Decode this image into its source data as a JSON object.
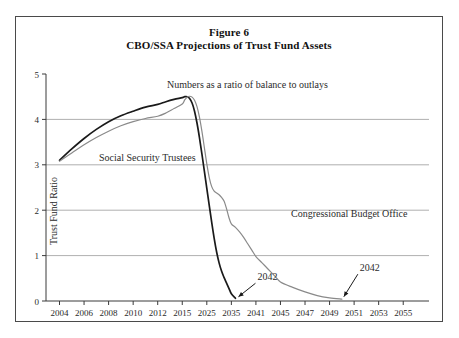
{
  "figure": {
    "title_line1": "Figure 6",
    "title_line2": "CBO/SSA Projections of Trust Fund Assets"
  },
  "chart_data": {
    "type": "line",
    "title": "CBO/SSA Projections of Trust Fund Assets",
    "subtitle": "Figure 6",
    "xlabel": "",
    "ylabel": "Trust Fund Ratio",
    "xlim": [
      2004,
      2056
    ],
    "ylim": [
      0,
      5
    ],
    "yticks": [
      0,
      1,
      2,
      3,
      4,
      5
    ],
    "xticks": [
      2004,
      2006,
      2008,
      2010,
      2012,
      2015,
      2025,
      2035,
      2041,
      2045,
      2047,
      2049,
      2051,
      2053,
      2055
    ],
    "xtick_labels": [
      "2004",
      "2006",
      "2008",
      "2010",
      "2012",
      "2015",
      "2025",
      "2035",
      "2041",
      "2045",
      "2047",
      "2049",
      "2051",
      "2053",
      "2055"
    ],
    "grid": "horizontal",
    "legend_position": "inline-annotations",
    "annotations": [
      {
        "name": "ratio-note",
        "text": "Numbers as a ratio of balance to outlays"
      },
      {
        "name": "trustees-label",
        "text": "Social Security Trustees"
      },
      {
        "name": "cbo-label",
        "text": "Congressional Budget Office"
      },
      {
        "name": "trustees-endpoint-year",
        "text": "2042"
      },
      {
        "name": "cbo-endpoint-year",
        "text": "2042"
      }
    ],
    "series": [
      {
        "name": "Social Security Trustees",
        "color": "#1a1a1a",
        "points": [
          [
            2004,
            3.1
          ],
          [
            2005,
            3.35
          ],
          [
            2006,
            3.58
          ],
          [
            2007,
            3.78
          ],
          [
            2008,
            3.95
          ],
          [
            2009,
            4.08
          ],
          [
            2010,
            4.18
          ],
          [
            2011,
            4.27
          ],
          [
            2012,
            4.33
          ],
          [
            2013,
            4.39
          ],
          [
            2014,
            4.44
          ],
          [
            2015,
            4.48
          ],
          [
            2016,
            4.5
          ],
          [
            2017,
            4.5
          ],
          [
            2018,
            4.46
          ],
          [
            2019,
            4.36
          ],
          [
            2020,
            4.18
          ],
          [
            2021,
            3.92
          ],
          [
            2022,
            3.6
          ],
          [
            2023,
            3.24
          ],
          [
            2024,
            2.86
          ],
          [
            2025,
            2.48
          ],
          [
            2026,
            2.1
          ],
          [
            2027,
            1.73
          ],
          [
            2028,
            1.38
          ],
          [
            2029,
            1.08
          ],
          [
            2030,
            0.84
          ],
          [
            2031,
            0.66
          ],
          [
            2032,
            0.52
          ],
          [
            2033,
            0.4
          ],
          [
            2034,
            0.28
          ],
          [
            2035,
            0.16
          ],
          [
            2036,
            0.06
          ]
        ]
      },
      {
        "name": "Congressional Budget Office",
        "color": "#8a8a8a",
        "points": [
          [
            2004,
            3.08
          ],
          [
            2005,
            3.26
          ],
          [
            2006,
            3.44
          ],
          [
            2007,
            3.6
          ],
          [
            2008,
            3.74
          ],
          [
            2009,
            3.86
          ],
          [
            2010,
            3.95
          ],
          [
            2011,
            4.02
          ],
          [
            2012,
            4.07
          ],
          [
            2013,
            4.14
          ],
          [
            2014,
            4.24
          ],
          [
            2015,
            4.34
          ],
          [
            2016,
            4.43
          ],
          [
            2017,
            4.49
          ],
          [
            2018,
            4.51
          ],
          [
            2019,
            4.49
          ],
          [
            2020,
            4.42
          ],
          [
            2021,
            4.28
          ],
          [
            2022,
            4.05
          ],
          [
            2023,
            3.74
          ],
          [
            2024,
            3.38
          ],
          [
            2025,
            3.02
          ],
          [
            2026,
            2.72
          ],
          [
            2027,
            2.52
          ],
          [
            2028,
            2.42
          ],
          [
            2029,
            2.38
          ],
          [
            2030,
            2.34
          ],
          [
            2031,
            2.28
          ],
          [
            2032,
            2.2
          ],
          [
            2033,
            2.04
          ],
          [
            2034,
            1.84
          ],
          [
            2035,
            1.7
          ],
          [
            2036,
            1.62
          ],
          [
            2037,
            1.52
          ],
          [
            2038,
            1.4
          ],
          [
            2039,
            1.26
          ],
          [
            2040,
            1.12
          ],
          [
            2041,
            0.98
          ],
          [
            2042,
            0.84
          ],
          [
            2043,
            0.7
          ],
          [
            2044,
            0.56
          ],
          [
            2045,
            0.42
          ],
          [
            2046,
            0.3
          ],
          [
            2047,
            0.2
          ],
          [
            2048,
            0.12
          ],
          [
            2049,
            0.07
          ],
          [
            2050,
            0.04
          ]
        ]
      }
    ]
  }
}
